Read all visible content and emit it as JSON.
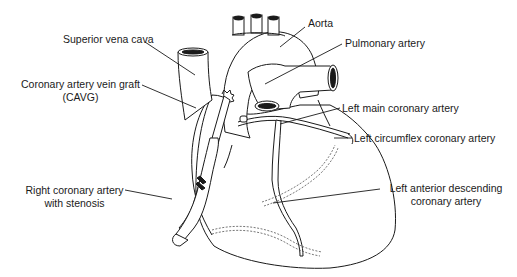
{
  "diagram": {
    "type": "anatomical-illustration",
    "labels": {
      "superior_vena_cava": "Superior vena cava",
      "aorta": "Aorta",
      "pulmonary_artery": "Pulmonary artery",
      "cavg_line1": "Coronary artery vein graft",
      "cavg_line2": "(CAVG)",
      "left_main": "Left main coronary artery",
      "left_circumflex": "Left circumflex coronary artery",
      "rca_line1": "Right coronary artery",
      "rca_line2": "with stenosis",
      "lad_line1": "Left anterior descending",
      "lad_line2": "coronary artery"
    },
    "colors": {
      "line": "#1a1a1a",
      "background": "#ffffff",
      "dashed": "#555555"
    }
  }
}
